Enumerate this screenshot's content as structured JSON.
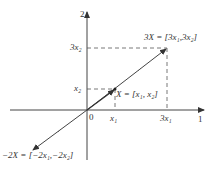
{
  "diagram": {
    "axes": {
      "x_label": "1",
      "y_label": "2",
      "origin_label": "0"
    },
    "ticks": {
      "x1": "x₁",
      "x3": "3x₁",
      "y1": "x₂",
      "y3": "3x₂"
    },
    "vectors": {
      "X": "X = [x₁, x₂]",
      "threeX": "3X = [3x₁,3x₂]",
      "minusTwoX": "−2X = [−2x₁,−2x₂]"
    },
    "colors": {
      "line": "#444444",
      "background": "#ffffff"
    }
  }
}
